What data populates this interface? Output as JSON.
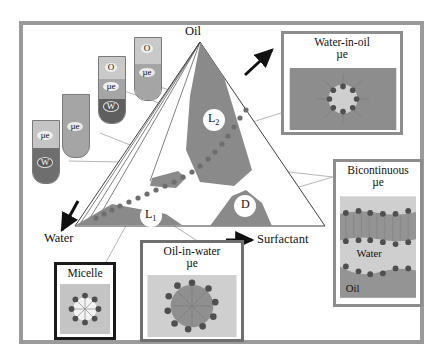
{
  "figure": {
    "type": "ternary-phase-diagram"
  },
  "corners": {
    "oil": "Oil",
    "water": "Water",
    "surfactant": "Surfactant"
  },
  "regions": [
    {
      "id": "L2",
      "label": "L",
      "sub": "2",
      "description": "oil-rich single phase"
    },
    {
      "id": "L1",
      "label": "L",
      "sub": "1",
      "description": "water-rich single phase"
    },
    {
      "id": "D",
      "label": "D",
      "sub": "",
      "description": "surfactant-rich phase"
    }
  ],
  "insets": [
    {
      "id": "water-in-oil",
      "line1": "Water-in-oil",
      "line2": "µe",
      "border": "#8d8d8d"
    },
    {
      "id": "bicontinuous",
      "line1": "Bicontinuous",
      "line2": "µe",
      "border": "#8d8d8d",
      "inner_labels": {
        "water": "Water",
        "oil": "Oil"
      }
    },
    {
      "id": "micelle",
      "line1": "Micelle",
      "line2": "",
      "border": "#1a1a1a"
    },
    {
      "id": "oil-in-water",
      "line1": "Oil-in-water",
      "line2": "µe",
      "border": "#6f6f6f"
    }
  ],
  "tubes": [
    {
      "id": "tube-ue-w",
      "phases": [
        "µe",
        "W"
      ]
    },
    {
      "id": "tube-ue",
      "phases": [
        "µe"
      ]
    },
    {
      "id": "tube-o-ue-w",
      "phases": [
        "O",
        "µe",
        "W"
      ]
    },
    {
      "id": "tube-o-ue",
      "phases": [
        "O",
        "µe"
      ]
    }
  ],
  "colors": {
    "frame": "#9a9a9a",
    "region_fill": "#8a8a8a",
    "light_phase": "#c9c9c9",
    "mid_phase": "#a5a5a5",
    "dark_phase": "#6e6e6e",
    "surfactant_dot": "#5f5f5f",
    "outline": "#3a3a3a",
    "leader": "#9d9d9d"
  }
}
